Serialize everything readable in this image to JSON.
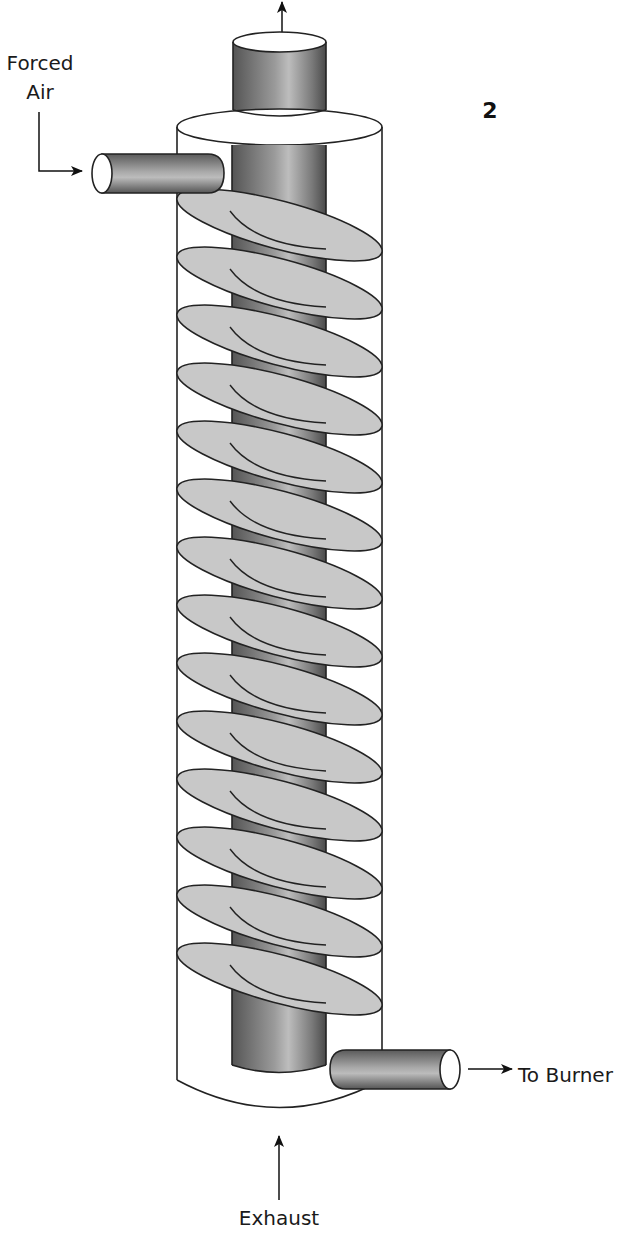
{
  "figure": {
    "number": "2",
    "labels": {
      "inlet": "Forced Air",
      "inlet_line1": "Forced",
      "inlet_line2": "Air",
      "outlet": "To Burner",
      "bottom_input": "Exhaust"
    },
    "components": {
      "outer_shell": "outer-cylinder",
      "central_pipe": "central-exhaust-pipe",
      "fins": "spiral-fins",
      "inlet_pipe": "forced-air-inlet-pipe",
      "outlet_pipe": "to-burner-outlet-pipe"
    },
    "colors": {
      "fin_fill": "#c8c8c8",
      "pipe_dark": "#5a5a5a",
      "pipe_light": "#b5b5b5",
      "outline": "#222222",
      "background": "#ffffff"
    },
    "fin_y_positions": [
      215,
      273,
      331,
      389,
      447,
      505,
      563,
      621,
      679,
      737,
      795,
      853,
      911,
      969
    ]
  }
}
